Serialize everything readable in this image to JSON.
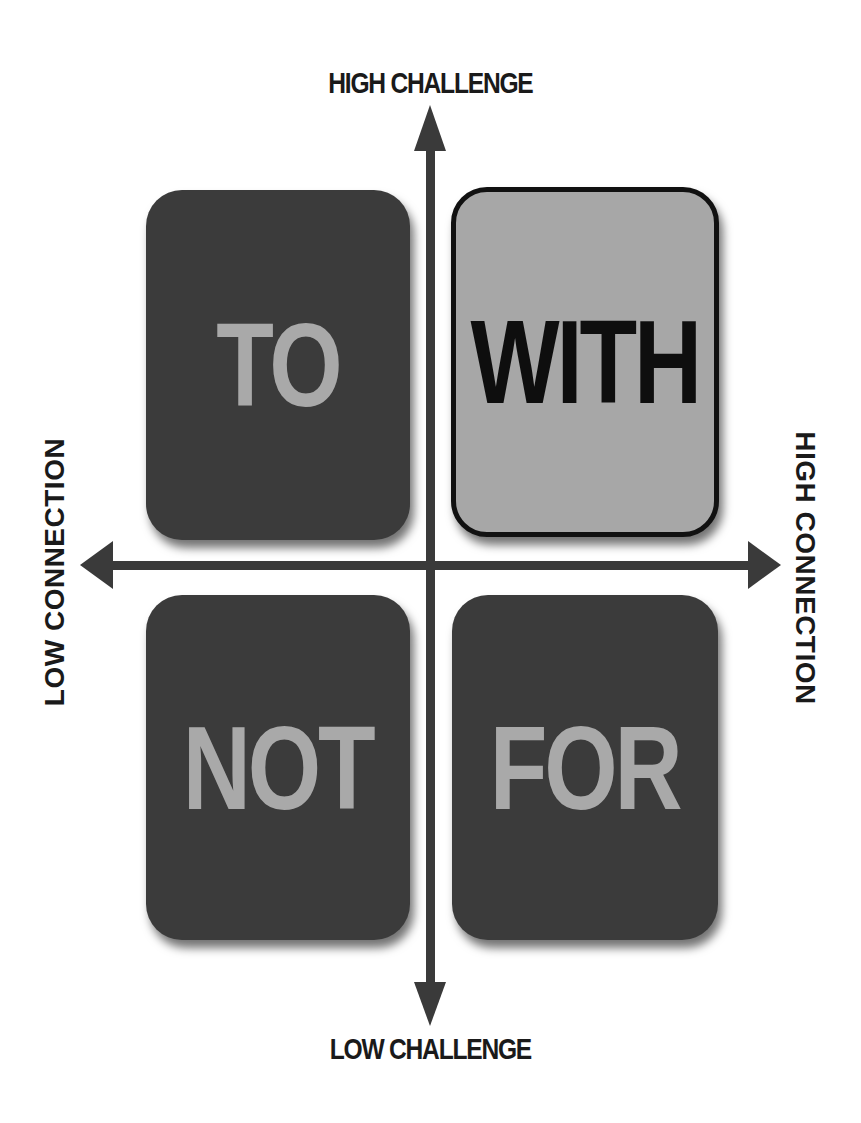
{
  "diagram": {
    "type": "quadrant-matrix",
    "axes": {
      "top": "HIGH CHALLENGE",
      "bottom": "LOW CHALLENGE",
      "left": "LOW CONNECTION",
      "right": "HIGH CONNECTION"
    },
    "quadrants": {
      "top_left": {
        "label": "TO",
        "highlighted": false
      },
      "top_right": {
        "label": "WITH",
        "highlighted": true
      },
      "bottom_left": {
        "label": "NOT",
        "highlighted": false
      },
      "bottom_right": {
        "label": "FOR",
        "highlighted": false
      }
    },
    "colors": {
      "dark_box": "#3b3b3b",
      "dark_box_text": "#a9a9a9",
      "highlight_box": "#a7a7a7",
      "highlight_text": "#0e0e0e",
      "axis": "#3a3a3a",
      "background": "#ffffff"
    }
  }
}
